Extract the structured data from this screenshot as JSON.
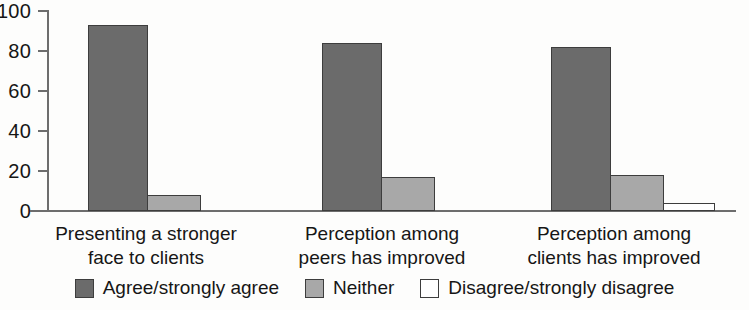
{
  "chart_data": {
    "type": "bar",
    "title": "",
    "subtitle": "",
    "xlabel": "",
    "ylabel": "",
    "ylim": [
      0,
      100
    ],
    "yticks": [
      0,
      20,
      40,
      60,
      80,
      100
    ],
    "ytick_labels": [
      "0",
      "20",
      "40",
      "60",
      "80",
      "100"
    ],
    "grid": false,
    "legend_position": "bottom",
    "categories": [
      "Presenting a stronger\nface to clients",
      "Perception among\npeers has improved",
      "Perception among\nclients has improved"
    ],
    "series": [
      {
        "name": "Agree/strongly agree",
        "color": "#6b6b6b",
        "values": [
          93,
          84,
          82
        ]
      },
      {
        "name": "Neither",
        "color": "#a8a8a8",
        "values": [
          8,
          17,
          18
        ]
      },
      {
        "name": "Disagree/strongly disagree",
        "color": "#ffffff",
        "values": [
          0,
          0,
          4
        ]
      }
    ]
  },
  "axis": {
    "tick_labels": [
      "100",
      "80",
      "60",
      "40",
      "20",
      "0"
    ],
    "axis_color": "#6d6d6d"
  },
  "legend": {
    "items": [
      {
        "label": "Agree/strongly agree",
        "swatch": "agree"
      },
      {
        "label": "Neither",
        "swatch": "neither"
      },
      {
        "label": "Disagree/strongly disagree",
        "swatch": "disagree"
      }
    ]
  },
  "categories": {
    "labels": [
      "Presenting a stronger\nface to clients",
      "Perception among\npeers has improved",
      "Perception among\nclients has improved"
    ]
  }
}
